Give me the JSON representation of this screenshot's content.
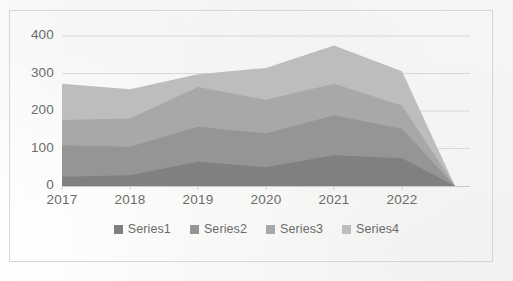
{
  "chart_data": {
    "type": "area",
    "stacked": true,
    "title": "",
    "subtitle": "",
    "xlabel": "",
    "ylabel": "",
    "categories": [
      "2017",
      "2018",
      "2019",
      "2020",
      "2021",
      "2022",
      ""
    ],
    "x_tick_labels": [
      "2017",
      "2018",
      "2019",
      "2020",
      "2021",
      "2022"
    ],
    "y_tick_labels": [
      "0",
      "100",
      "200",
      "300",
      "400"
    ],
    "ylim": [
      0,
      400
    ],
    "y_ticks": [
      0,
      100,
      200,
      300,
      400
    ],
    "grid": true,
    "grid_axis": "y",
    "legend_position": "bottom",
    "series": [
      {
        "name": "Series1",
        "color": "#808080",
        "values": [
          25,
          29,
          65,
          50,
          82,
          74,
          0
        ],
        "cumulative": [
          25,
          29,
          65,
          50,
          82,
          74,
          0
        ]
      },
      {
        "name": "Series2",
        "color": "#959595",
        "values": [
          84,
          76,
          93,
          90,
          107,
          79,
          0
        ],
        "cumulative": [
          109,
          105,
          158,
          140,
          189,
          153,
          0
        ]
      },
      {
        "name": "Series3",
        "color": "#a8a8a8",
        "values": [
          67,
          75,
          106,
          90,
          84,
          62,
          0
        ],
        "cumulative": [
          176,
          180,
          264,
          230,
          273,
          215,
          0
        ]
      },
      {
        "name": "Series4",
        "color": "#bdbdbd",
        "values": [
          97,
          78,
          34,
          85,
          102,
          91,
          0
        ],
        "cumulative": [
          273,
          258,
          298,
          315,
          375,
          306,
          0
        ]
      }
    ],
    "totals": [
      273,
      258,
      298,
      315,
      375,
      306,
      0
    ]
  },
  "legend": {
    "items": [
      {
        "label": "Series1",
        "color": "#808080",
        "swatch": "legend-swatch-series1"
      },
      {
        "label": "Series2",
        "color": "#959595",
        "swatch": "legend-swatch-series2"
      },
      {
        "label": "Series3",
        "color": "#a8a8a8",
        "swatch": "legend-swatch-series3"
      },
      {
        "label": "Series4",
        "color": "#bdbdbd",
        "swatch": "legend-swatch-series4"
      }
    ]
  },
  "style": {
    "gridline_color": "#d9d9d9",
    "text_color": "#6b6b6b",
    "border_color": "#d6d6d4",
    "background": "#fdfdfc"
  }
}
